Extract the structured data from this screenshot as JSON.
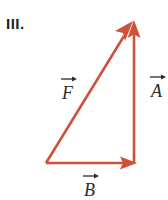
{
  "figure": {
    "item_label": "III.",
    "background_color": "#ffffff",
    "vector_color": "#d0503a",
    "label_color": "#2b2b2b",
    "width": 168,
    "height": 200
  },
  "vectors": [
    {
      "name": "A",
      "label": "A",
      "accent": "right-arrow-accent",
      "description": "vertical vector pointing up along right side",
      "from": [
        134,
        163
      ],
      "to": [
        134,
        22
      ],
      "label_pos": [
        150,
        82
      ]
    },
    {
      "name": "B",
      "label": "B",
      "accent": "right-arrow-accent",
      "description": "horizontal vector pointing right along bottom",
      "from": [
        46,
        163
      ],
      "to": [
        136,
        163
      ],
      "label_pos": [
        84,
        180
      ]
    },
    {
      "name": "F",
      "label": "F",
      "accent": "right-arrow-accent",
      "description": "resultant diagonal vector from bottom-left to apex",
      "from": [
        46,
        163
      ],
      "to": [
        133,
        22
      ],
      "label_pos": [
        62,
        86
      ]
    }
  ]
}
